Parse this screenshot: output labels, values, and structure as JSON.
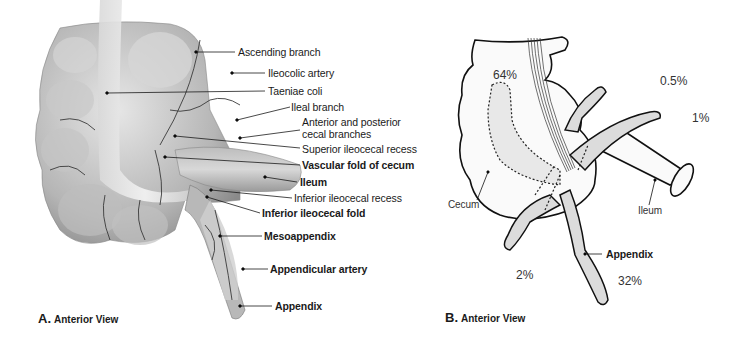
{
  "figure": {
    "panel_a": {
      "caption_letter": "A.",
      "caption_text": "Anterior View",
      "labels": [
        {
          "id": "ascending-branch",
          "text": "Ascending branch",
          "bold": false
        },
        {
          "id": "ileocolic-artery",
          "text": "Ileocolic artery",
          "bold": false
        },
        {
          "id": "taeniae-coli",
          "text": "Taeniae coli",
          "bold": false
        },
        {
          "id": "ileal-branch",
          "text": "Ileal branch",
          "bold": false
        },
        {
          "id": "cecal-branches-1",
          "text": "Anterior and posterior",
          "bold": false
        },
        {
          "id": "cecal-branches-2",
          "text": "cecal branches",
          "bold": false
        },
        {
          "id": "superior-ileocecal-recess",
          "text": "Superior ileocecal recess",
          "bold": false
        },
        {
          "id": "vascular-fold-of-cecum",
          "text": "Vascular fold of cecum",
          "bold": true
        },
        {
          "id": "ileum",
          "text": "Ileum",
          "bold": true
        },
        {
          "id": "inferior-ileocecal-recess",
          "text": "Inferior ileocecal recess",
          "bold": false
        },
        {
          "id": "inferior-ileocecal-fold",
          "text": "Inferior ileocecal fold",
          "bold": true
        },
        {
          "id": "mesoappendix",
          "text": "Mesoappendix",
          "bold": true
        },
        {
          "id": "appendicular-artery",
          "text": "Appendicular artery",
          "bold": true
        },
        {
          "id": "appendix",
          "text": "Appendix",
          "bold": true
        }
      ]
    },
    "panel_b": {
      "caption_letter": "B.",
      "caption_text": "Anterior View",
      "labels": {
        "cecum": "Cecum",
        "ileum": "Ileum",
        "appendix": "Appendix"
      },
      "percentages": {
        "retrocecal": "64%",
        "preileal": "0.5%",
        "postileal": "1%",
        "subcecal": "2%",
        "pelvic": "32%"
      }
    }
  }
}
